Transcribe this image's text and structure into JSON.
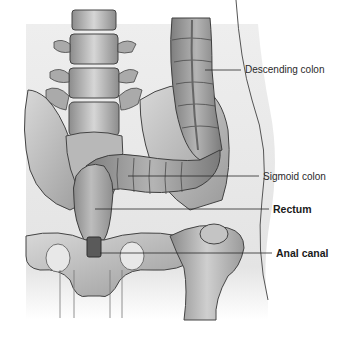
{
  "figure": {
    "style": "grayscale medical illustration",
    "background": "#ffffff",
    "body_bg": "#e6e6e6",
    "line_color": "#3a3a3a"
  },
  "labels": [
    {
      "id": "descending-colon",
      "text": "Descending colon",
      "bold": false,
      "x": 245,
      "y": 64,
      "line_from": [
        205,
        70
      ],
      "line_to": [
        241,
        70
      ]
    },
    {
      "id": "sigmoid-colon",
      "text": "Sigmoid colon",
      "bold": false,
      "x": 263,
      "y": 171,
      "line_from": [
        128,
        176
      ],
      "line_to": [
        259,
        176
      ]
    },
    {
      "id": "rectum",
      "text": "Rectum",
      "bold": true,
      "x": 273,
      "y": 204,
      "line_from": [
        95,
        209
      ],
      "line_to": [
        269,
        209
      ]
    },
    {
      "id": "anal-canal",
      "text": "Anal canal",
      "bold": true,
      "x": 276,
      "y": 248,
      "line_from": [
        100,
        253
      ],
      "line_to": [
        272,
        253
      ]
    }
  ]
}
